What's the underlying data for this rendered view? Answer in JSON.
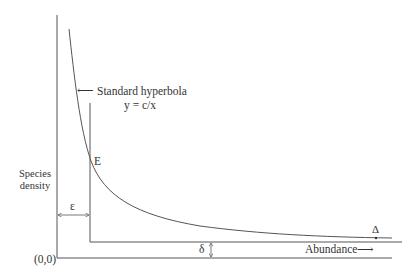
{
  "diagram": {
    "curve_label": "Standard hyperbola",
    "curve_equation": "y = c/x",
    "curve_arrow": "⟵",
    "point_label": "E",
    "y_axis_label_line1": "Species",
    "y_axis_label_line2": "density",
    "origin_label": "(0,0)",
    "epsilon_label": "ε",
    "delta_label": "δ",
    "Delta_label": "Δ",
    "x_axis_label": "Abundance",
    "x_axis_arrow": "⟶",
    "colors": {
      "line": "#555555",
      "text": "#333333",
      "background": "#ffffff"
    }
  }
}
